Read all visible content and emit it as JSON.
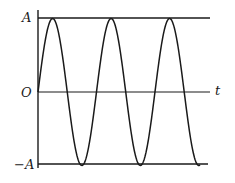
{
  "diagram": {
    "type": "sine-wave-graph",
    "labels": {
      "amplitude_top": "A",
      "origin": "O",
      "amplitude_bottom": "−A",
      "time_axis": "t"
    },
    "curve": {
      "function": "A·sin(ωt)",
      "periods_shown": 2.77,
      "starts_at": "origin, rising",
      "ends": "below zero line, descending"
    },
    "colors": {
      "line": "#1a1a1a",
      "background": "#ffffff"
    }
  }
}
